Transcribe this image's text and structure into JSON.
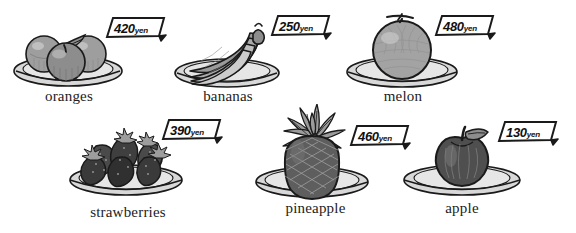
{
  "page": {
    "currency_unit": "yen",
    "background_color": "#ffffff",
    "ink_color": "#1a1a1a",
    "rows": 2,
    "columns": 3
  },
  "items": [
    {
      "id": "oranges",
      "label": "oranges",
      "price": "420",
      "unit": "yen",
      "icon": "oranges-on-plate-icon",
      "row": 1,
      "column": 1
    },
    {
      "id": "bananas",
      "label": "bananas",
      "price": "250",
      "unit": "yen",
      "icon": "bananas-on-plate-icon",
      "row": 1,
      "column": 2
    },
    {
      "id": "melon",
      "label": "melon",
      "price": "480",
      "unit": "yen",
      "icon": "melon-on-plate-icon",
      "row": 1,
      "column": 3
    },
    {
      "id": "strawberries",
      "label": "strawberries",
      "price": "390",
      "unit": "yen",
      "icon": "strawberries-on-plate-icon",
      "row": 2,
      "column": 1
    },
    {
      "id": "pineapple",
      "label": "pineapple",
      "price": "460",
      "unit": "yen",
      "icon": "pineapple-on-plate-icon",
      "row": 2,
      "column": 2
    },
    {
      "id": "apple",
      "label": "apple",
      "price": "130",
      "unit": "yen",
      "icon": "apple-on-plate-icon",
      "row": 2,
      "column": 3
    }
  ],
  "palette": {
    "outline": "#1a1a1a",
    "plate_light": "#e2e2e2",
    "plate_mid": "#c9c9c9",
    "plate_shadow": "#b0b0b0",
    "fruit_light": "#cfcfcf",
    "fruit_mid": "#a8a8a8",
    "fruit_dark": "#6f6f6f",
    "fruit_darker": "#4a4a4a",
    "berry_dark": "#3a3a3a",
    "tag_fill": "#ffffff"
  }
}
